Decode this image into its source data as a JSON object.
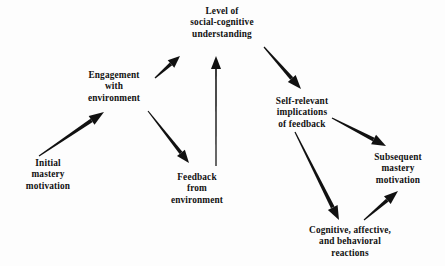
{
  "figure": {
    "type": "flow-diagram",
    "background_color": "#fdfdfd",
    "ink_color": "#111111"
  },
  "nodes": [
    {
      "id": "level-of-social-cognitive-understanding",
      "lines": [
        "Level of",
        "social-cognitive",
        "understanding"
      ],
      "cx": 222,
      "top": 6
    },
    {
      "id": "engagement-with-environment",
      "lines": [
        "Engagement",
        "with",
        "environment"
      ],
      "cx": 114,
      "top": 70
    },
    {
      "id": "self-relevant-implications-of-feedback",
      "lines": [
        "Self-relevant",
        "implications",
        "of  feedback"
      ],
      "cx": 302,
      "top": 96
    },
    {
      "id": "initial-mastery-motivation",
      "lines": [
        "Initial",
        "mastery",
        "motivation"
      ],
      "cx": 48,
      "top": 158
    },
    {
      "id": "feedback-from-environment",
      "lines": [
        "Feedback",
        "from",
        "environment"
      ],
      "cx": 197,
      "top": 172
    },
    {
      "id": "subsequent-mastery-motivation",
      "lines": [
        "Subsequent",
        "mastery",
        "motivation"
      ],
      "cx": 398,
      "top": 152
    },
    {
      "id": "cognitive-affective-and-behavioral-reactions",
      "lines": [
        "Cognitive,  affective,",
        "and  behavioral",
        "reactions"
      ],
      "cx": 350,
      "top": 225
    }
  ],
  "arrows": [
    {
      "id": "initial-mastery-to-engagement",
      "from": "initial-mastery-motivation",
      "to": "engagement-with-environment",
      "x1": 39,
      "y1": 156,
      "x2": 104,
      "y2": 112,
      "tail_width": 1.1,
      "head_width": 4.0,
      "head_length": 15,
      "head_halfwidth": 5.2
    },
    {
      "id": "engagement-to-level",
      "from": "engagement-with-environment",
      "to": "level-of-social-cognitive-understanding",
      "x1": 155,
      "y1": 78,
      "x2": 180,
      "y2": 56,
      "tail_width": 1.3,
      "head_width": 3.6,
      "head_length": 12,
      "head_halfwidth": 5.0
    },
    {
      "id": "engagement-to-feedback",
      "from": "engagement-with-environment",
      "to": "feedback-from-environment",
      "x1": 148,
      "y1": 111,
      "x2": 189,
      "y2": 163,
      "tail_width": 1.1,
      "head_width": 3.6,
      "head_length": 13,
      "head_halfwidth": 5.0
    },
    {
      "id": "feedback-to-level",
      "from": "feedback-from-environment",
      "to": "level-of-social-cognitive-understanding",
      "x1": 216,
      "y1": 166,
      "x2": 216,
      "y2": 56,
      "tail_width": 1.2,
      "head_width": 1.6,
      "head_length": 13,
      "head_halfwidth": 5.0
    },
    {
      "id": "level-to-self-relevant",
      "from": "level-of-social-cognitive-understanding",
      "to": "self-relevant-implications-of-feedback",
      "x1": 264,
      "y1": 47,
      "x2": 301,
      "y2": 89,
      "tail_width": 1.2,
      "head_width": 3.8,
      "head_length": 14,
      "head_halfwidth": 5.2
    },
    {
      "id": "self-relevant-to-subsequent",
      "from": "self-relevant-implications-of-feedback",
      "to": "subsequent-mastery-motivation",
      "x1": 332,
      "y1": 118,
      "x2": 386,
      "y2": 146,
      "tail_width": 1.2,
      "head_width": 4.0,
      "head_length": 14,
      "head_halfwidth": 5.4
    },
    {
      "id": "self-relevant-to-cognitive",
      "from": "self-relevant-implications-of-feedback",
      "to": "cognitive-affective-and-behavioral-reactions",
      "x1": 295,
      "y1": 132,
      "x2": 339,
      "y2": 220,
      "tail_width": 1.2,
      "head_width": 4.0,
      "head_length": 14,
      "head_halfwidth": 5.4
    },
    {
      "id": "cognitive-to-subsequent",
      "from": "cognitive-affective-and-behavioral-reactions",
      "to": "subsequent-mastery-motivation",
      "x1": 364,
      "y1": 220,
      "x2": 398,
      "y2": 191,
      "tail_width": 1.1,
      "head_width": 3.8,
      "head_length": 14,
      "head_halfwidth": 5.2
    }
  ]
}
